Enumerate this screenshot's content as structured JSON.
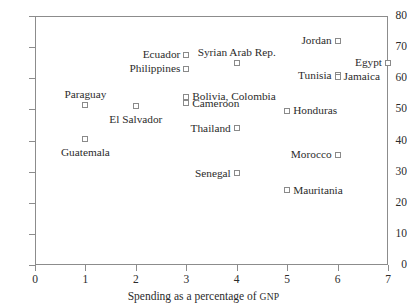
{
  "chart_data": {
    "type": "scatter",
    "title": "",
    "xlabel": "Spending as a percentage of GNP",
    "ylabel": "",
    "xlim": [
      0,
      7
    ],
    "ylim": [
      0,
      80
    ],
    "xticks": [
      0,
      1,
      2,
      3,
      4,
      5,
      6,
      7
    ],
    "yticks": [
      0,
      10,
      20,
      30,
      40,
      50,
      60,
      70,
      80
    ],
    "grid": false,
    "legend": false,
    "marker": "square-open",
    "marker_color": "#8a8a8a",
    "frame_color": "#8c8c8c",
    "points": [
      {
        "label": "Jordan",
        "x": 6,
        "y": 72.0,
        "label_side": "left"
      },
      {
        "label": "Ecuador",
        "x": 3,
        "y": 67.5,
        "label_side": "left"
      },
      {
        "label": "Syrian Arab Rep.",
        "x": 4,
        "y": 65.0,
        "label_side": "above"
      },
      {
        "label": "Egypt",
        "x": 7,
        "y": 65.0,
        "label_side": "left"
      },
      {
        "label": "Philippines",
        "x": 3,
        "y": 63.0,
        "label_side": "left"
      },
      {
        "label": "Tunisia",
        "x": 6,
        "y": 61.0,
        "label_side": "left"
      },
      {
        "label": "Jamaica",
        "x": 6,
        "y": 60.5,
        "label_side": "right"
      },
      {
        "label": "Bolivia, Colombia",
        "x": 3,
        "y": 54.0,
        "label_side": "right"
      },
      {
        "label": "Cameroon",
        "x": 3,
        "y": 52.0,
        "label_side": "right"
      },
      {
        "label": "Paraguay",
        "x": 1,
        "y": 51.5,
        "label_side": "above"
      },
      {
        "label": "El Salvador",
        "x": 2,
        "y": 51.0,
        "label_side": "below"
      },
      {
        "label": "Honduras",
        "x": 5,
        "y": 49.5,
        "label_side": "right"
      },
      {
        "label": "Thailand",
        "x": 4,
        "y": 44.0,
        "label_side": "left"
      },
      {
        "label": "Guatemala",
        "x": 1,
        "y": 40.5,
        "label_side": "below"
      },
      {
        "label": "Morocco",
        "x": 6,
        "y": 35.5,
        "label_side": "left"
      },
      {
        "label": "Senegal",
        "x": 4,
        "y": 29.5,
        "label_side": "left"
      },
      {
        "label": "Mauritania",
        "x": 5,
        "y": 24.0,
        "label_side": "right"
      }
    ]
  },
  "axis": {
    "x_title_main": "Spending as a percentage of ",
    "x_title_smallcaps": "GNP"
  }
}
